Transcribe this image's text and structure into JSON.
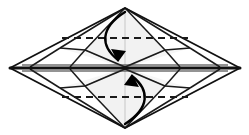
{
  "figure": {
    "type": "origami-step-diagram",
    "canvas": {
      "width": 249,
      "height": 135
    },
    "background_color": "#ffffff"
  },
  "colors": {
    "outline": "#111111",
    "crease_light": "#b9b9b9",
    "crease_mid": "#3a3a3a",
    "dashed_fold": "#1a1a1a",
    "arrow": "#000000",
    "paper_front": "#ffffff",
    "paper_shaded": "#f2f2f2",
    "paper_shaded_deep": "#e9e9e9"
  },
  "geometry": {
    "apex_top": {
      "x": 125,
      "y": 8
    },
    "apex_bottom": {
      "x": 125,
      "y": 128
    },
    "tip_left": {
      "x": 10,
      "y": 68
    },
    "tip_right": {
      "x": 240,
      "y": 68
    },
    "center": {
      "x": 125,
      "y": 68
    },
    "inner_left": {
      "x": 60,
      "y": 48
    },
    "inner_right": {
      "x": 190,
      "y": 48
    }
  },
  "elements": {
    "outer_diamond": {
      "name": "outer diamond outline",
      "points": "125,8 240,68 125,128 10,68",
      "stroke_width": 1.8
    },
    "center_line": {
      "name": "horizontal center fold",
      "x1": 10,
      "y1": 68,
      "x2": 240,
      "y2": 68,
      "stroke_width": 3.0
    },
    "dashed_fold_top": {
      "name": "top valley fold line",
      "x1": 62,
      "y1": 38,
      "x2": 188,
      "y2": 38,
      "dash": "7 5",
      "stroke_width": 2.2
    },
    "dashed_fold_bottom": {
      "name": "bottom valley fold line",
      "x1": 62,
      "y1": 97,
      "x2": 188,
      "y2": 97,
      "dash": "7 5",
      "stroke_width": 2.2
    },
    "arrow_top": {
      "name": "fold-down arrow",
      "path": "M 125 12 C 100 28 100 46 118 60",
      "direction": "down",
      "head": "118,62 111,49 126,51"
    },
    "arrow_bottom": {
      "name": "fold-up arrow",
      "path": "M 125 124 C 150 108 150 90 132 76",
      "direction": "up",
      "head": "132,74 139,87 124,85"
    }
  },
  "labels": {
    "caption": "",
    "step_number": ""
  }
}
